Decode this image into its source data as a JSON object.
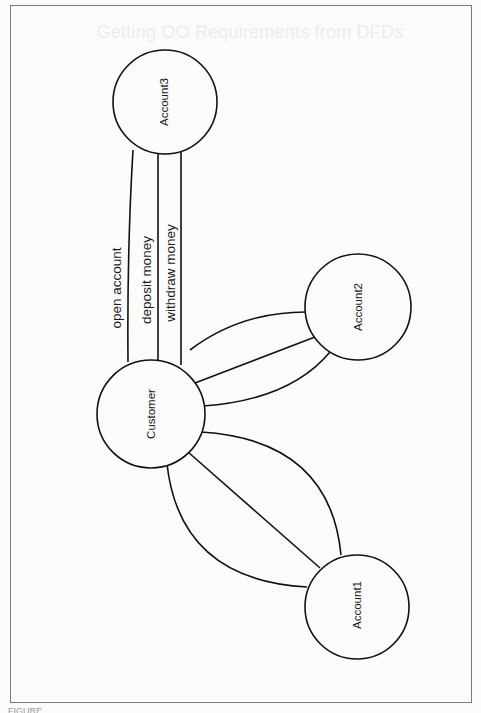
{
  "page": {
    "ghost_heading": "Getting OO Requirements from DFDs",
    "caption": "FIGURE"
  },
  "diagram": {
    "nodes": [
      {
        "id": "account3",
        "label": "Account3",
        "cx": 165,
        "cy": 102,
        "r": 52
      },
      {
        "id": "customer",
        "label": "Customer",
        "cx": 151,
        "cy": 414,
        "r": 54
      },
      {
        "id": "account2",
        "label": "Account2",
        "cx": 358,
        "cy": 307,
        "r": 53
      },
      {
        "id": "account1",
        "label": "Account1",
        "cx": 357,
        "cy": 607,
        "r": 52
      }
    ],
    "flows": [
      {
        "from": "customer",
        "to": "account3",
        "label": "open account"
      },
      {
        "from": "customer",
        "to": "account3",
        "label": "deposit money"
      },
      {
        "from": "customer",
        "to": "account3",
        "label": "withdraw money"
      }
    ],
    "edges_customer_account2": 3,
    "edges_customer_account1": 3
  },
  "colors": {
    "stroke": "#111111",
    "frame": "#7a7a7a",
    "background": "#fbfbfa"
  }
}
